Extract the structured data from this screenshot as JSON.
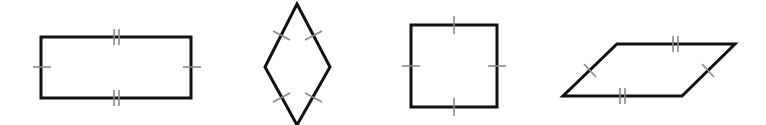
{
  "figure": {
    "colors": {
      "outline": "#111111",
      "tick": "#8a8a8a",
      "background": "#ffffff"
    },
    "shapes": [
      {
        "name": "rectangle",
        "vertices": [
          [
            41,
            37
          ],
          [
            191,
            37
          ],
          [
            191,
            98
          ],
          [
            41,
            98
          ]
        ],
        "tick_marks": {
          "top": 2,
          "bottom": 2,
          "left": 1,
          "right": 1
        }
      },
      {
        "name": "rhombus",
        "vertices": [
          [
            297,
            4
          ],
          [
            330,
            67
          ],
          [
            297,
            125
          ],
          [
            265,
            67
          ]
        ],
        "tick_marks": {
          "upper-left": 1,
          "upper-right": 1,
          "lower-left": 1,
          "lower-right": 1
        }
      },
      {
        "name": "square",
        "vertices": [
          [
            411,
            25
          ],
          [
            497,
            25
          ],
          [
            497,
            107
          ],
          [
            411,
            107
          ]
        ],
        "tick_marks": {
          "top": 1,
          "bottom": 1,
          "left": 1,
          "right": 1
        }
      },
      {
        "name": "parallelogram",
        "vertices": [
          [
            617,
            44
          ],
          [
            735,
            44
          ],
          [
            682,
            96
          ],
          [
            563,
            96
          ]
        ],
        "tick_marks": {
          "top": 2,
          "bottom": 2,
          "left": 1,
          "right": 1
        }
      }
    ]
  }
}
